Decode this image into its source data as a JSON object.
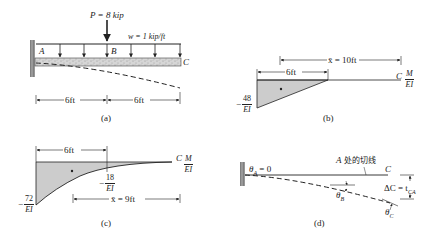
{
  "figure_a": {
    "load_label": "P = 8 kip",
    "dist_load_label": "w = 1 kip/ft",
    "point_A": "A",
    "point_B": "B",
    "point_C": "C",
    "dim_left": "6ft",
    "dim_right": "6ft",
    "caption": "(a)"
  },
  "figure_b": {
    "xbar_label": "x̄ = 10ft",
    "dim_label": "6ft",
    "point_C": "C",
    "axis_num": "M",
    "axis_den": "EI",
    "value_neg": "−",
    "value_num": "48",
    "value_den": "EI",
    "caption": "(b)"
  },
  "figure_c": {
    "dim_label": "6ft",
    "point_C": "C",
    "axis_num": "M",
    "axis_den": "EI",
    "mid_neg": "−",
    "mid_num": "18",
    "mid_den": "EI",
    "end_neg": "−",
    "end_num": "72",
    "end_den": "EI",
    "xbar_label": "x̄ = 9ft",
    "caption": "(c)"
  },
  "figure_d": {
    "theta_A": "θ",
    "theta_A_sub": "A",
    "theta_A_val": " = 0",
    "tangent_label_A": "A",
    "tangent_label_cn": " 处的切线",
    "point_C": "C",
    "delta_label": "ΔC = t",
    "delta_sub": "CA",
    "theta_B": "θ",
    "theta_B_sub": "B",
    "theta_C": "θ",
    "theta_C_sub": "C",
    "caption": "(d)"
  }
}
